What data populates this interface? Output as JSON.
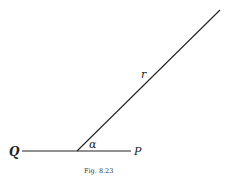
{
  "figure": {
    "caption": "Fig. 8.23",
    "labels": {
      "q": "Q",
      "p": "P",
      "r": "r",
      "alpha": "α"
    },
    "colors": {
      "ink": "#222222",
      "background": "#ffffff"
    }
  }
}
